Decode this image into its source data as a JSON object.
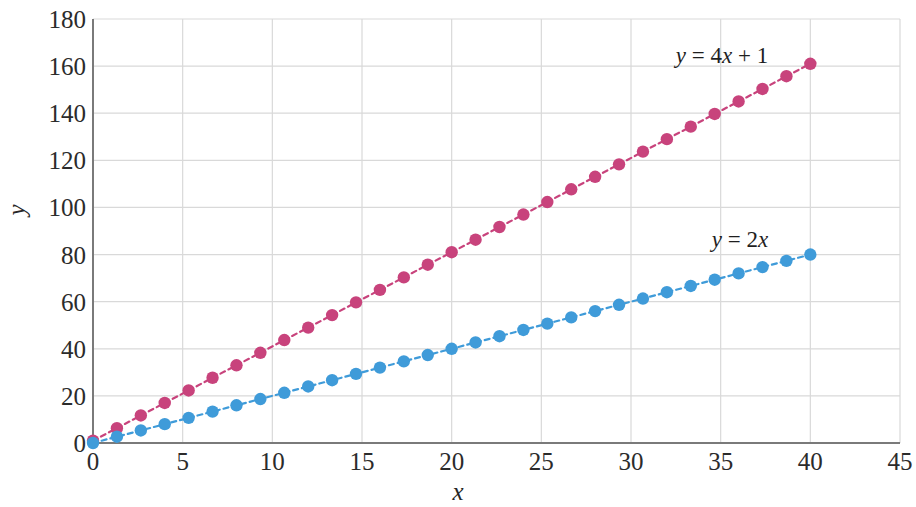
{
  "chart_data": {
    "type": "scatter",
    "title": "",
    "xlabel": "x",
    "ylabel": "y",
    "xlim": [
      0,
      45
    ],
    "ylim": [
      0,
      180
    ],
    "xticks": [
      0,
      5,
      10,
      15,
      20,
      25,
      30,
      35,
      40,
      45
    ],
    "xtick_labels": [
      "0",
      "5",
      "10",
      "15",
      "20",
      "25",
      "30",
      "35",
      "40",
      "45"
    ],
    "yticks": [
      0,
      20,
      40,
      60,
      80,
      100,
      120,
      140,
      160,
      180
    ],
    "ytick_labels": [
      "0",
      "20",
      "40",
      "60",
      "80",
      "100",
      "120",
      "140",
      "160",
      "180"
    ],
    "grid": true,
    "legend_position": "inline-annotation",
    "series": [
      {
        "name": "y = 4x + 1",
        "label_html": "<i>y</i> = 4<i>x</i> + 1",
        "color": "#c8437c",
        "marker": "circle",
        "linestyle": "dashed",
        "annotation_x": 32.5,
        "annotation_y": 163,
        "x": [
          0,
          1.333,
          2.667,
          4,
          5.333,
          6.667,
          8,
          9.333,
          10.667,
          12,
          13.333,
          14.667,
          16,
          17.333,
          18.667,
          20,
          21.333,
          22.667,
          24,
          25.333,
          26.667,
          28,
          29.333,
          30.667,
          32,
          33.333,
          34.667,
          36,
          37.333,
          38.667,
          40
        ],
        "y": [
          1,
          6.3,
          11.7,
          17,
          22.3,
          27.7,
          33,
          38.3,
          43.7,
          49,
          54.3,
          59.7,
          65,
          70.3,
          75.7,
          81,
          86.3,
          91.7,
          97,
          102.3,
          107.7,
          113,
          118.3,
          123.7,
          129,
          134.3,
          139.7,
          145,
          150.3,
          155.7,
          161
        ]
      },
      {
        "name": "y = 2x",
        "label_html": "<i>y</i> = 2<i>x</i>",
        "color": "#3f9bd9",
        "marker": "circle",
        "linestyle": "dashed",
        "annotation_x": 34.5,
        "annotation_y": 85,
        "x": [
          0,
          1.333,
          2.667,
          4,
          5.333,
          6.667,
          8,
          9.333,
          10.667,
          12,
          13.333,
          14.667,
          16,
          17.333,
          18.667,
          20,
          21.333,
          22.667,
          24,
          25.333,
          26.667,
          28,
          29.333,
          30.667,
          32,
          33.333,
          34.667,
          36,
          37.333,
          38.667,
          40
        ],
        "y": [
          0,
          2.67,
          5.33,
          8,
          10.67,
          13.33,
          16,
          18.67,
          21.33,
          24,
          26.67,
          29.33,
          32,
          34.67,
          37.33,
          40,
          42.67,
          45.33,
          48,
          50.67,
          53.33,
          56,
          58.67,
          61.33,
          64,
          66.67,
          69.33,
          72,
          74.67,
          77.33,
          80
        ]
      }
    ],
    "axis_color": "#808080",
    "grid_color": "#d9d9d9",
    "background_color": "#ffffff",
    "equations": {
      "pink": "y = 4x + 1",
      "blue": "y = 2x"
    }
  }
}
